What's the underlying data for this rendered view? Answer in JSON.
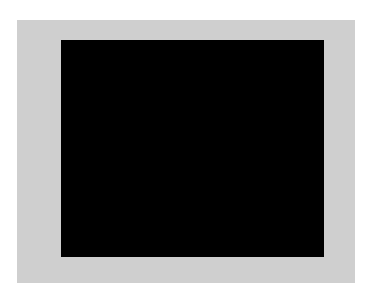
{
  "chart_data": {
    "type": "heatmap",
    "title": "",
    "xlabel": "",
    "ylabel": "real part",
    "rows": 32,
    "cols": 32,
    "xticks": [
      5,
      10,
      15,
      20,
      25,
      30
    ],
    "yticks": [
      5,
      10,
      15,
      20,
      25,
      30
    ],
    "x_axis_position": "top",
    "diagonal_value": 1,
    "off_diagonal_value": 0,
    "colors": {
      "high": "#c9c9c9",
      "low": "#5c5c5c",
      "grid": "#000000",
      "background": "#cfcfcf"
    },
    "grid": true
  }
}
